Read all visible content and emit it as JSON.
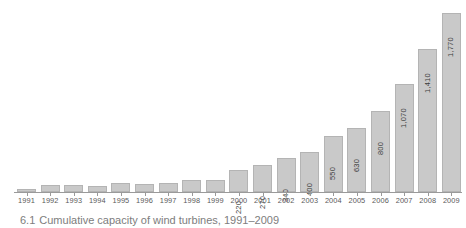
{
  "figure": {
    "background_color": "#ffffff",
    "bar_fill_color": "#c9c9c9",
    "bar_border_color": "#b4b4b4",
    "axis_color": "#9a9a9a",
    "label_color": "#5a5a5a",
    "value_label_color": "#3c3c3c"
  },
  "caption": {
    "number": "6.1",
    "text": "Cumulative capacity of wind turbines, 1991–2009",
    "note": "caption is cropped by the bottom edge of the screenshot"
  },
  "chart_data": {
    "type": "bar",
    "title": "",
    "subtitle": "",
    "xlabel": "",
    "ylabel": "",
    "grid": false,
    "legend": false,
    "ylim": [
      0,
      1800
    ],
    "categories": [
      "1991",
      "1992",
      "1993",
      "1994",
      "1995",
      "1996",
      "1997",
      "1998",
      "1999",
      "2000",
      "2001",
      "2002",
      "2003",
      "2004",
      "2005",
      "2006",
      "2007",
      "2008",
      "2009"
    ],
    "values": [
      20,
      70,
      70,
      60,
      90,
      80,
      90,
      120,
      120,
      220,
      270,
      340,
      400,
      550,
      630,
      800,
      1070,
      1410,
      1770
    ],
    "value_labels": [
      "",
      "",
      "",
      "",
      "",
      "",
      "",
      "",
      "",
      "220",
      "270",
      "340",
      "400",
      "550",
      "630",
      "800",
      "1,070",
      "1,410",
      "1,770"
    ],
    "value_label_rotation": -90,
    "bars": [
      {
        "year": "1991",
        "value": 20,
        "label": ""
      },
      {
        "year": "1992",
        "value": 70,
        "label": ""
      },
      {
        "year": "1993",
        "value": 70,
        "label": ""
      },
      {
        "year": "1994",
        "value": 60,
        "label": ""
      },
      {
        "year": "1995",
        "value": 90,
        "label": ""
      },
      {
        "year": "1996",
        "value": 80,
        "label": ""
      },
      {
        "year": "1997",
        "value": 90,
        "label": ""
      },
      {
        "year": "1998",
        "value": 120,
        "label": ""
      },
      {
        "year": "1999",
        "value": 120,
        "label": ""
      },
      {
        "year": "2000",
        "value": 220,
        "label": "220"
      },
      {
        "year": "2001",
        "value": 270,
        "label": "270"
      },
      {
        "year": "2002",
        "value": 340,
        "label": "340"
      },
      {
        "year": "2003",
        "value": 400,
        "label": "400"
      },
      {
        "year": "2004",
        "value": 550,
        "label": "550"
      },
      {
        "year": "2005",
        "value": 630,
        "label": "630"
      },
      {
        "year": "2006",
        "value": 800,
        "label": "800"
      },
      {
        "year": "2007",
        "value": 1070,
        "label": "1,070"
      },
      {
        "year": "2008",
        "value": 1410,
        "label": "1,410"
      },
      {
        "year": "2009",
        "value": 1770,
        "label": "1,770"
      }
    ]
  }
}
